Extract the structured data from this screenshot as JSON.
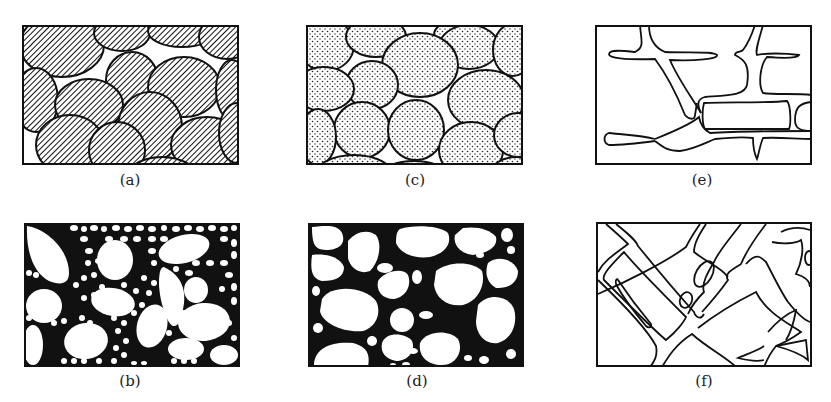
{
  "figure": {
    "panels": [
      {
        "id": "a",
        "label": "(a)",
        "description": "Closely packed hatched grains with small white interstices"
      },
      {
        "id": "b",
        "label": "(b)",
        "description": "Large white grains embedded in a matrix of many small white grains with black boundaries"
      },
      {
        "id": "c",
        "label": "(c)",
        "description": "Closely packed dotted (stippled) grains with small white interstices"
      },
      {
        "id": "d",
        "label": "(d)",
        "description": "White grains of varying size in a continuous black matrix"
      },
      {
        "id": "e",
        "label": "(e)",
        "description": "Outlined branching channel network on white background"
      },
      {
        "id": "f",
        "label": "(f)",
        "description": "Outlined criss-crossing diagonal channel network"
      }
    ]
  },
  "colors": {
    "ink": "#111111",
    "paper": "#ffffff"
  }
}
